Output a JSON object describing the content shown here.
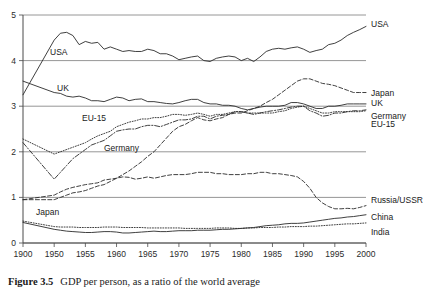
{
  "caption": {
    "label": "Figure 3.5",
    "text": "GDP per person, as a ratio of the world average"
  },
  "chart_data": {
    "type": "line",
    "title": "GDP per person, as a ratio of the world average",
    "xlabel": "",
    "ylabel": "",
    "xlim": [
      1900,
      2000
    ],
    "ylim": [
      0,
      5
    ],
    "grid": true,
    "legend_position": "right-of-axes-inline",
    "x_tick_labels": [
      "1900",
      "1950",
      "1955",
      "1960",
      "1965",
      "1970",
      "1975",
      "1980",
      "1985",
      "1990",
      "1995",
      "2000"
    ],
    "x_tick_values": [
      1900,
      1950,
      1955,
      1960,
      1965,
      1970,
      1975,
      1980,
      1985,
      1990,
      1995,
      2000
    ],
    "y_tick_labels": [
      "0",
      "1",
      "2",
      "3",
      "4",
      "5"
    ],
    "y_tick_values": [
      0,
      1,
      2,
      3,
      4,
      5
    ],
    "x_axis_note": "non-linear first interval: 1900 to 1950 occupies one tick spacing, then 5-year intervals",
    "x": [
      1900,
      1950,
      1951,
      1952,
      1953,
      1954,
      1955,
      1956,
      1957,
      1958,
      1959,
      1960,
      1961,
      1962,
      1963,
      1964,
      1965,
      1966,
      1967,
      1968,
      1969,
      1970,
      1971,
      1972,
      1973,
      1974,
      1975,
      1976,
      1977,
      1978,
      1979,
      1980,
      1981,
      1982,
      1983,
      1984,
      1985,
      1986,
      1987,
      1988,
      1989,
      1990,
      1991,
      1992,
      1993,
      1994,
      1995,
      1996,
      1997,
      1998,
      1999,
      2000
    ],
    "series": [
      {
        "name": "USA",
        "style": "solid",
        "inline_label": "USA",
        "right_label": "USA",
        "values": [
          3.25,
          4.45,
          4.6,
          4.62,
          4.55,
          4.35,
          4.42,
          4.38,
          4.4,
          4.25,
          4.3,
          4.25,
          4.2,
          4.22,
          4.2,
          4.2,
          4.25,
          4.22,
          4.15,
          4.15,
          4.1,
          4.02,
          4.05,
          4.08,
          4.1,
          4.0,
          3.98,
          4.05,
          4.08,
          4.1,
          4.08,
          4.0,
          4.05,
          3.98,
          4.08,
          4.2,
          4.25,
          4.27,
          4.25,
          4.28,
          4.3,
          4.25,
          4.18,
          4.22,
          4.25,
          4.35,
          4.38,
          4.45,
          4.55,
          4.62,
          4.68,
          4.75
        ]
      },
      {
        "name": "UK",
        "style": "solid",
        "inline_label": "UK",
        "right_label": "UK",
        "values": [
          3.55,
          3.3,
          3.28,
          3.22,
          3.2,
          3.22,
          3.18,
          3.12,
          3.12,
          3.1,
          3.15,
          3.2,
          3.18,
          3.12,
          3.15,
          3.16,
          3.1,
          3.1,
          3.08,
          3.06,
          3.05,
          3.08,
          3.12,
          3.15,
          3.15,
          3.08,
          3.05,
          3.05,
          3.02,
          3.02,
          3.0,
          2.95,
          2.92,
          2.95,
          2.98,
          3.0,
          3.0,
          3.0,
          3.02,
          3.08,
          3.08,
          3.05,
          3.0,
          2.95,
          2.95,
          3.0,
          3.0,
          3.02,
          3.05,
          3.05,
          3.05,
          3.05
        ]
      },
      {
        "name": "EU-15",
        "style": "dotted",
        "inline_label": "EU-15",
        "right_label": "EU-15",
        "values": [
          2.28,
          1.95,
          2.0,
          2.05,
          2.1,
          2.15,
          2.2,
          2.28,
          2.35,
          2.4,
          2.45,
          2.55,
          2.6,
          2.65,
          2.68,
          2.72,
          2.72,
          2.75,
          2.75,
          2.78,
          2.82,
          2.82,
          2.8,
          2.82,
          2.85,
          2.82,
          2.78,
          2.82,
          2.82,
          2.85,
          2.88,
          2.88,
          2.85,
          2.85,
          2.85,
          2.85,
          2.85,
          2.88,
          2.9,
          2.95,
          2.98,
          3.0,
          2.95,
          2.9,
          2.85,
          2.85,
          2.88,
          2.88,
          2.88,
          2.88,
          2.88,
          2.9
        ]
      },
      {
        "name": "Germany",
        "style": "dashdot",
        "inline_label": "Germany",
        "right_label": "Germany",
        "values": [
          2.2,
          1.4,
          1.55,
          1.7,
          1.85,
          1.95,
          2.05,
          2.15,
          2.2,
          2.25,
          2.35,
          2.45,
          2.48,
          2.5,
          2.5,
          2.55,
          2.58,
          2.58,
          2.55,
          2.6,
          2.65,
          2.7,
          2.7,
          2.72,
          2.78,
          2.78,
          2.72,
          2.78,
          2.8,
          2.82,
          2.88,
          2.88,
          2.85,
          2.82,
          2.85,
          2.88,
          2.9,
          2.92,
          2.95,
          2.98,
          3.0,
          3.0,
          2.9,
          2.85,
          2.78,
          2.8,
          2.85,
          2.85,
          2.88,
          2.9,
          2.9,
          2.92
        ]
      },
      {
        "name": "Japan",
        "style": "dashed",
        "inline_label": "Japan",
        "right_label": "Japan",
        "values": [
          0.95,
          0.95,
          1.0,
          1.05,
          1.1,
          1.12,
          1.15,
          1.2,
          1.25,
          1.28,
          1.35,
          1.42,
          1.5,
          1.58,
          1.68,
          1.78,
          1.9,
          2.0,
          2.15,
          2.3,
          2.45,
          2.55,
          2.6,
          2.68,
          2.75,
          2.7,
          2.68,
          2.72,
          2.75,
          2.82,
          2.85,
          2.85,
          2.9,
          2.95,
          3.0,
          3.08,
          3.15,
          3.25,
          3.35,
          3.45,
          3.55,
          3.6,
          3.6,
          3.55,
          3.5,
          3.48,
          3.45,
          3.4,
          3.35,
          3.3,
          3.3,
          3.3
        ]
      },
      {
        "name": "Russia/USSR",
        "style": "dashed",
        "inline_label": "",
        "right_label": "Russia/USSR",
        "values": [
          0.95,
          1.05,
          1.12,
          1.18,
          1.22,
          1.25,
          1.28,
          1.3,
          1.32,
          1.38,
          1.4,
          1.42,
          1.45,
          1.44,
          1.4,
          1.42,
          1.45,
          1.42,
          1.45,
          1.48,
          1.5,
          1.5,
          1.5,
          1.52,
          1.55,
          1.55,
          1.55,
          1.52,
          1.52,
          1.5,
          1.5,
          1.5,
          1.52,
          1.52,
          1.55,
          1.55,
          1.52,
          1.52,
          1.5,
          1.48,
          1.45,
          1.35,
          1.2,
          1.0,
          0.88,
          0.8,
          0.75,
          0.75,
          0.76,
          0.75,
          0.78,
          0.82
        ]
      },
      {
        "name": "China",
        "style": "solid",
        "inline_label": "",
        "right_label": "China",
        "values": [
          0.45,
          0.3,
          0.28,
          0.26,
          0.25,
          0.24,
          0.23,
          0.23,
          0.24,
          0.25,
          0.25,
          0.24,
          0.22,
          0.22,
          0.23,
          0.24,
          0.25,
          0.26,
          0.25,
          0.25,
          0.26,
          0.27,
          0.27,
          0.27,
          0.28,
          0.28,
          0.28,
          0.29,
          0.3,
          0.3,
          0.31,
          0.32,
          0.33,
          0.34,
          0.36,
          0.38,
          0.39,
          0.4,
          0.42,
          0.43,
          0.43,
          0.44,
          0.46,
          0.48,
          0.5,
          0.52,
          0.54,
          0.55,
          0.57,
          0.58,
          0.6,
          0.62
        ]
      },
      {
        "name": "India",
        "style": "dotted",
        "inline_label": "",
        "right_label": "India",
        "values": [
          0.48,
          0.36,
          0.35,
          0.35,
          0.35,
          0.34,
          0.34,
          0.34,
          0.34,
          0.35,
          0.35,
          0.35,
          0.34,
          0.34,
          0.34,
          0.34,
          0.33,
          0.33,
          0.33,
          0.33,
          0.33,
          0.33,
          0.32,
          0.32,
          0.32,
          0.32,
          0.32,
          0.33,
          0.33,
          0.33,
          0.32,
          0.32,
          0.33,
          0.33,
          0.34,
          0.34,
          0.34,
          0.35,
          0.35,
          0.36,
          0.36,
          0.36,
          0.37,
          0.37,
          0.38,
          0.39,
          0.4,
          0.41,
          0.42,
          0.42,
          0.43,
          0.44
        ]
      }
    ]
  }
}
